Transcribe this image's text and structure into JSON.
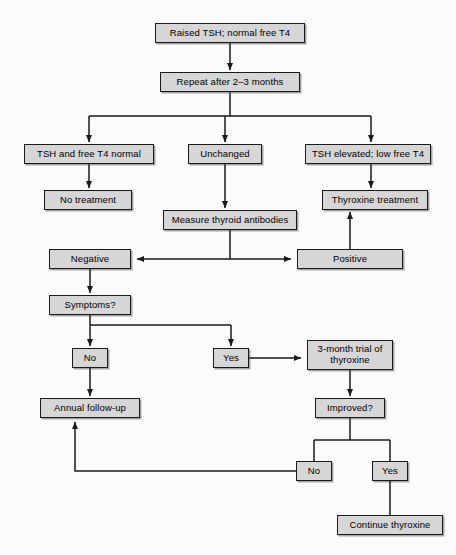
{
  "diagram": {
    "background_color": "#fbfbfb",
    "node_fill_color": "#d6d6d6",
    "node_border_color": "#1a1a1a",
    "connector_color": "#1a1a1a",
    "nodes": [
      {
        "id": "raised-tsh",
        "label": "Raised TSH; normal free T4",
        "x": 155,
        "y": 23,
        "w": 150,
        "h": 20
      },
      {
        "id": "repeat",
        "label": "Repeat after 2–3 months",
        "x": 160,
        "y": 72,
        "w": 140,
        "h": 20
      },
      {
        "id": "tsh-free-t4-normal",
        "label": "TSH and free T4 normal",
        "x": 24,
        "y": 144,
        "w": 130,
        "h": 20
      },
      {
        "id": "unchanged",
        "label": "Unchanged",
        "x": 188,
        "y": 144,
        "w": 74,
        "h": 20
      },
      {
        "id": "tsh-elevated",
        "label": "TSH elevated; low free T4",
        "x": 305,
        "y": 144,
        "w": 126,
        "h": 20
      },
      {
        "id": "no-treatment",
        "label": "No treatment",
        "x": 44,
        "y": 190,
        "w": 88,
        "h": 20
      },
      {
        "id": "measure-antibodies",
        "label": "Measure thyroid antibodies",
        "x": 163,
        "y": 210,
        "w": 134,
        "h": 20
      },
      {
        "id": "thyroxine-treatment",
        "label": "Thyroxine treatment",
        "x": 322,
        "y": 190,
        "w": 106,
        "h": 20
      },
      {
        "id": "negative",
        "label": "Negative",
        "x": 49,
        "y": 249,
        "w": 82,
        "h": 20
      },
      {
        "id": "positive",
        "label": "Positive",
        "x": 297,
        "y": 249,
        "w": 106,
        "h": 20
      },
      {
        "id": "symptoms",
        "label": "Symptoms?",
        "x": 49,
        "y": 295,
        "w": 82,
        "h": 20
      },
      {
        "id": "no-symptoms",
        "label": "No",
        "x": 72,
        "y": 348,
        "w": 36,
        "h": 20
      },
      {
        "id": "yes-symptoms",
        "label": "Yes",
        "x": 213,
        "y": 348,
        "w": 36,
        "h": 20
      },
      {
        "id": "three-month-trial",
        "label": "3-month trial of\nthyroxine",
        "x": 307,
        "y": 340,
        "w": 86,
        "h": 30
      },
      {
        "id": "annual-follow-up",
        "label": "Annual follow-up",
        "x": 40,
        "y": 398,
        "w": 100,
        "h": 20
      },
      {
        "id": "improved",
        "label": "Improved?",
        "x": 315,
        "y": 398,
        "w": 70,
        "h": 20
      },
      {
        "id": "no-improved",
        "label": "No",
        "x": 296,
        "y": 461,
        "w": 36,
        "h": 20
      },
      {
        "id": "yes-improved",
        "label": "Yes",
        "x": 372,
        "y": 461,
        "w": 36,
        "h": 20
      },
      {
        "id": "continue-thyroxine",
        "label": "Continue thyroxine",
        "x": 337,
        "y": 515,
        "w": 106,
        "h": 20
      }
    ],
    "connectors": [
      {
        "id": "raised-to-repeat",
        "from": "raised-tsh",
        "to": "repeat",
        "kind": "arrow-down"
      },
      {
        "id": "repeat-to-branch",
        "from": "repeat",
        "to": "three-way-split",
        "kind": "split-three"
      },
      {
        "id": "normal-to-no-treatment",
        "from": "tsh-free-t4-normal",
        "to": "no-treatment",
        "kind": "arrow-down"
      },
      {
        "id": "unchanged-to-measure",
        "from": "unchanged",
        "to": "measure-antibodies",
        "kind": "arrow-down"
      },
      {
        "id": "elevated-to-thyroxine",
        "from": "tsh-elevated",
        "to": "thyroxine-treatment",
        "kind": "arrow-down"
      },
      {
        "id": "measure-to-negative",
        "from": "measure-antibodies",
        "to": "negative",
        "kind": "elbow-left-arrow"
      },
      {
        "id": "measure-to-positive",
        "from": "measure-antibodies",
        "to": "positive",
        "kind": "elbow-right-arrow"
      },
      {
        "id": "positive-to-thyroxine",
        "from": "positive",
        "to": "thyroxine-treatment",
        "kind": "arrow-up"
      },
      {
        "id": "negative-to-symptoms",
        "from": "negative",
        "to": "symptoms",
        "kind": "arrow-down"
      },
      {
        "id": "symptoms-to-no",
        "from": "symptoms",
        "to": "no-symptoms",
        "kind": "arrow-down"
      },
      {
        "id": "symptoms-to-yes",
        "from": "symptoms",
        "to": "yes-symptoms",
        "kind": "elbow-right-arrow"
      },
      {
        "id": "yes-to-trial",
        "from": "yes-symptoms",
        "to": "three-month-trial",
        "kind": "arrow-right"
      },
      {
        "id": "no-to-annual-follow-up",
        "from": "no-symptoms",
        "to": "annual-follow-up",
        "kind": "arrow-down"
      },
      {
        "id": "trial-to-improved",
        "from": "three-month-trial",
        "to": "improved",
        "kind": "arrow-down"
      },
      {
        "id": "improved-to-no",
        "from": "improved",
        "to": "no-improved",
        "kind": "split-left"
      },
      {
        "id": "improved-to-yes",
        "from": "improved",
        "to": "yes-improved",
        "kind": "split-right"
      },
      {
        "id": "no-improved-to-annual",
        "from": "no-improved",
        "to": "annual-follow-up",
        "kind": "feedback-arrow-up"
      },
      {
        "id": "yes-improved-to-continue",
        "from": "yes-improved",
        "to": "continue-thyroxine",
        "kind": "line-down"
      }
    ]
  }
}
